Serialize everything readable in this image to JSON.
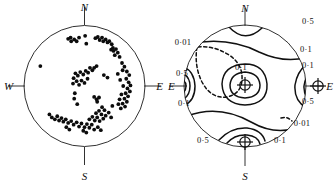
{
  "figure": {
    "title": "",
    "panels": [
      {
        "id": "left",
        "kind": "stereonet-scatter",
        "description": "Equal-area stereographic projection with poles plotted as filled dots"
      },
      {
        "id": "right",
        "kind": "stereonet-contour",
        "description": "Equal-area stereographic projection with density contours and maxima symbols"
      }
    ]
  },
  "cardinals": {
    "north": "N",
    "south": "S",
    "east": "E",
    "west": "W"
  },
  "left_panel": {
    "labels": {
      "north": "N",
      "south": "S",
      "east": "E",
      "west": "W"
    }
  },
  "right_panel": {
    "labels": {
      "north": "N",
      "south": "S",
      "east_right": "E",
      "east_left": "E"
    },
    "contour_labels": [
      {
        "id": "top-right-05",
        "text": "0·5",
        "x": 141,
        "y": 24
      },
      {
        "id": "upper-left-001",
        "text": "0·01",
        "x": 16,
        "y": 45
      },
      {
        "id": "right-upper-01",
        "text": "0·1",
        "x": 139,
        "y": 52
      },
      {
        "id": "right-mid-01",
        "text": "0·1",
        "x": 141,
        "y": 68
      },
      {
        "id": "left-05",
        "text": "0·5",
        "x": 15,
        "y": 76
      },
      {
        "id": "center-01",
        "text": "0·1",
        "x": 74,
        "y": 70
      },
      {
        "id": "left-01",
        "text": "0·1",
        "x": 17,
        "y": 106
      },
      {
        "id": "right-lower-05",
        "text": "0·5",
        "x": 141,
        "y": 104
      },
      {
        "id": "lower-right-001",
        "text": "0·01",
        "x": 135,
        "y": 126
      },
      {
        "id": "bottom-01",
        "text": "0·1",
        "x": 113,
        "y": 143
      },
      {
        "id": "bottom-05",
        "text": "0·5",
        "x": 36,
        "y": 143
      }
    ]
  },
  "chart_data": {
    "type": "scatter",
    "title": "",
    "xlabel": "",
    "ylabel": "",
    "projection": "equal-area stereographic (lower hemisphere)",
    "grid": false,
    "legend": null,
    "axis_labels": [
      "N",
      "E",
      "S",
      "W"
    ],
    "contour_levels": [
      "0·01",
      "0·1",
      "0·5"
    ],
    "maxima_count": 3,
    "point_count": 111,
    "points_note": "Positions given as fractions of circle radius from centre; +x = East, +y = North",
    "points": [
      [
        -0.27,
        0.78
      ],
      [
        -0.23,
        0.8
      ],
      [
        -0.22,
        0.74
      ],
      [
        -0.17,
        0.77
      ],
      [
        -0.13,
        0.74
      ],
      [
        -0.09,
        0.8
      ],
      [
        0.01,
        0.83
      ],
      [
        0.03,
        0.7
      ],
      [
        0.18,
        0.79
      ],
      [
        0.22,
        0.81
      ],
      [
        0.25,
        0.76
      ],
      [
        0.29,
        0.8
      ],
      [
        0.31,
        0.74
      ],
      [
        0.35,
        0.77
      ],
      [
        0.38,
        0.72
      ],
      [
        0.41,
        0.74
      ],
      [
        0.45,
        0.69
      ],
      [
        0.47,
        0.63
      ],
      [
        0.44,
        0.6
      ],
      [
        0.48,
        0.58
      ],
      [
        0.52,
        0.61
      ],
      [
        0.55,
        0.55
      ],
      [
        0.5,
        0.51
      ],
      [
        0.58,
        0.48
      ],
      [
        -0.73,
        0.33
      ],
      [
        0.62,
        0.38
      ],
      [
        0.66,
        0.32
      ],
      [
        0.63,
        0.26
      ],
      [
        0.7,
        0.24
      ],
      [
        0.74,
        0.18
      ],
      [
        0.69,
        0.12
      ],
      [
        0.73,
        0.06
      ],
      [
        0.76,
        0.01
      ],
      [
        0.71,
        -0.04
      ],
      [
        0.75,
        -0.09
      ],
      [
        0.68,
        -0.12
      ],
      [
        0.72,
        -0.17
      ],
      [
        0.66,
        -0.21
      ],
      [
        0.7,
        -0.26
      ],
      [
        0.63,
        -0.29
      ],
      [
        0.67,
        -0.34
      ],
      [
        0.6,
        -0.37
      ],
      [
        0.56,
        -0.3
      ],
      [
        0.58,
        -0.22
      ],
      [
        0.61,
        -0.14
      ],
      [
        0.64,
        0.0
      ],
      [
        0.59,
        0.1
      ],
      [
        0.55,
        0.2
      ],
      [
        0.2,
        0.33
      ],
      [
        0.16,
        0.3
      ],
      [
        0.13,
        0.26
      ],
      [
        0.09,
        0.3
      ],
      [
        0.06,
        0.22
      ],
      [
        0.02,
        0.25
      ],
      [
        -0.02,
        0.19
      ],
      [
        -0.07,
        0.23
      ],
      [
        -0.11,
        0.17
      ],
      [
        -0.15,
        0.21
      ],
      [
        -0.18,
        0.13
      ],
      [
        -0.13,
        0.08
      ],
      [
        -0.19,
        0.04
      ],
      [
        -0.09,
        0.02
      ],
      [
        -0.05,
        0.09
      ],
      [
        0.0,
        0.05
      ],
      [
        0.05,
        0.12
      ],
      [
        0.32,
        0.18
      ],
      [
        0.38,
        0.14
      ],
      [
        -0.16,
        -0.12
      ],
      [
        -0.17,
        -0.21
      ],
      [
        -0.12,
        -0.3
      ],
      [
        0.16,
        -0.18
      ],
      [
        0.2,
        -0.22
      ],
      [
        0.24,
        -0.19
      ],
      [
        0.21,
        -0.26
      ],
      [
        0.46,
        -0.33
      ],
      [
        -0.58,
        -0.47
      ],
      [
        -0.54,
        -0.52
      ],
      [
        -0.49,
        -0.55
      ],
      [
        -0.45,
        -0.5
      ],
      [
        -0.42,
        -0.57
      ],
      [
        -0.38,
        -0.53
      ],
      [
        -0.35,
        -0.59
      ],
      [
        -0.31,
        -0.55
      ],
      [
        -0.27,
        -0.61
      ],
      [
        -0.22,
        -0.58
      ],
      [
        -0.18,
        -0.64
      ],
      [
        -0.13,
        -0.6
      ],
      [
        -0.09,
        -0.67
      ],
      [
        -0.05,
        -0.62
      ],
      [
        0.0,
        -0.68
      ],
      [
        0.04,
        -0.63
      ],
      [
        0.08,
        -0.69
      ],
      [
        0.12,
        -0.64
      ],
      [
        0.08,
        -0.55
      ],
      [
        0.13,
        -0.51
      ],
      [
        0.17,
        -0.57
      ],
      [
        0.21,
        -0.52
      ],
      [
        0.25,
        -0.58
      ],
      [
        0.19,
        -0.45
      ],
      [
        0.24,
        -0.41
      ],
      [
        0.28,
        -0.47
      ],
      [
        0.31,
        -0.54
      ],
      [
        0.35,
        -0.49
      ],
      [
        0.33,
        -0.4
      ],
      [
        0.29,
        -0.35
      ],
      [
        0.4,
        -0.44
      ],
      [
        0.44,
        -0.52
      ],
      [
        -0.02,
        -0.74
      ],
      [
        0.03,
        -0.77
      ],
      [
        -0.3,
        -0.68
      ],
      [
        -0.25,
        -0.72
      ],
      [
        0.16,
        -0.72
      ],
      [
        0.22,
        -0.68
      ],
      [
        0.27,
        -0.73
      ]
    ],
    "maxima": [
      {
        "label": "central maximum",
        "x": 0.02,
        "y": -0.04
      },
      {
        "label": "east maximum",
        "x": 0.78,
        "y": -0.02
      },
      {
        "label": "south maximum",
        "x": -0.05,
        "y": -0.8
      }
    ]
  }
}
